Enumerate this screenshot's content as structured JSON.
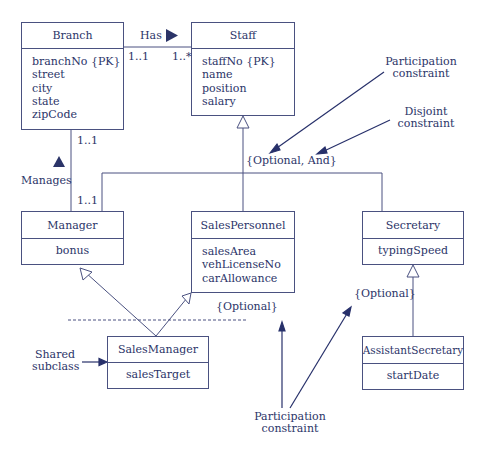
{
  "diagram": {
    "classes": {
      "branch": {
        "name": "Branch",
        "attributes": [
          "branchNo {PK}",
          "street",
          "city",
          "state",
          "zipCode"
        ]
      },
      "staff": {
        "name": "Staff",
        "attributes": [
          "staffNo {PK}",
          "name",
          "position",
          "salary"
        ]
      },
      "manager": {
        "name": "Manager",
        "attributes": [
          "bonus"
        ]
      },
      "sales_personnel": {
        "name": "SalesPersonnel",
        "attributes": [
          "salesArea",
          "vehLicenseNo",
          "carAllowance"
        ]
      },
      "secretary": {
        "name": "Secretary",
        "attributes": [
          "typingSpeed"
        ]
      },
      "sales_manager": {
        "name": "SalesManager",
        "attributes": [
          "salesTarget"
        ]
      },
      "assistant_secretary": {
        "name": "AssistantSecretary",
        "attributes": [
          "startDate"
        ]
      }
    },
    "associations": {
      "has": {
        "label": "Has",
        "mult_branch": "1..1",
        "mult_staff": "1..*"
      },
      "manages": {
        "label": "Manages",
        "mult_branch": "1..1",
        "mult_manager": "1..1"
      }
    },
    "constraints": {
      "staff_specialization": "{Optional, And}",
      "salespersonnel_specialization": "{Optional}",
      "secretary_specialization": "{Optional}"
    },
    "annotations": {
      "participation_top": [
        "Participation",
        "constraint"
      ],
      "disjoint": [
        "Disjoint",
        "constraint"
      ],
      "shared_subclass": [
        "Shared",
        "subclass"
      ],
      "participation_bottom": [
        "Participation",
        "constraint"
      ]
    },
    "colors": {
      "ink": "#2b3468",
      "line": "#4a5180",
      "arrow": "#27306a"
    }
  }
}
